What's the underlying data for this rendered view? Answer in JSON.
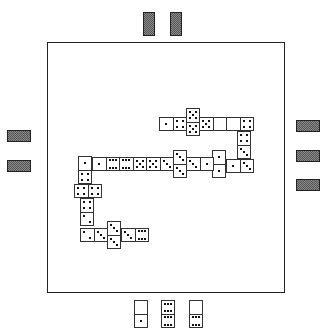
{
  "game": {
    "title": "Dominoes",
    "colors": {
      "background": "#ffffff",
      "frame": "#222222",
      "tile_face": "#ffffff",
      "tile_back": "#8a8a8a",
      "pip": "#111111"
    }
  },
  "opponents": {
    "top": {
      "hidden_tiles": 2,
      "backs": [
        {
          "x": 143,
          "y": 12,
          "w": 12,
          "h": 24
        },
        {
          "x": 170,
          "y": 12,
          "w": 12,
          "h": 24
        }
      ]
    },
    "left": {
      "hidden_tiles": 2,
      "backs": [
        {
          "x": 7,
          "y": 130,
          "w": 24,
          "h": 12
        },
        {
          "x": 7,
          "y": 160,
          "w": 24,
          "h": 12
        }
      ]
    },
    "right": {
      "hidden_tiles": 3,
      "backs": [
        {
          "x": 296,
          "y": 120,
          "w": 24,
          "h": 12
        },
        {
          "x": 296,
          "y": 150,
          "w": 24,
          "h": 12
        },
        {
          "x": 296,
          "y": 179,
          "w": 24,
          "h": 12
        }
      ]
    }
  },
  "player_hand": {
    "tiles": [
      {
        "a": 0,
        "b": 1,
        "x": 134,
        "y": 300,
        "w": 14,
        "h": 28,
        "orient": "v"
      },
      {
        "a": 6,
        "b": 6,
        "x": 161,
        "y": 300,
        "w": 14,
        "h": 28,
        "orient": "v"
      },
      {
        "a": 0,
        "b": 6,
        "x": 189,
        "y": 300,
        "w": 14,
        "h": 28,
        "orient": "v"
      }
    ]
  },
  "chain": {
    "tiles": [
      {
        "a": 1,
        "b": 4,
        "x": 159,
        "y": 117,
        "w": 28,
        "h": 14,
        "orient": "h"
      },
      {
        "a": 5,
        "b": 5,
        "x": 186,
        "y": 108,
        "w": 14,
        "h": 28,
        "orient": "v"
      },
      {
        "a": 5,
        "b": 0,
        "x": 199,
        "y": 117,
        "w": 28,
        "h": 14,
        "orient": "h"
      },
      {
        "a": 0,
        "b": 4,
        "x": 226,
        "y": 117,
        "w": 28,
        "h": 14,
        "orient": "h"
      },
      {
        "a": 4,
        "b": 3,
        "x": 237,
        "y": 131,
        "w": 14,
        "h": 28,
        "orient": "v"
      },
      {
        "a": 1,
        "b": 3,
        "x": 226,
        "y": 159,
        "w": 28,
        "h": 14,
        "orient": "h"
      },
      {
        "a": 1,
        "b": 1,
        "x": 212,
        "y": 150,
        "w": 14,
        "h": 28,
        "orient": "v"
      },
      {
        "a": 3,
        "b": 1,
        "x": 186,
        "y": 157,
        "w": 28,
        "h": 14,
        "orient": "h"
      },
      {
        "a": 3,
        "b": 3,
        "x": 173,
        "y": 150,
        "w": 14,
        "h": 28,
        "orient": "v"
      },
      {
        "a": 5,
        "b": 3,
        "x": 146,
        "y": 157,
        "w": 28,
        "h": 14,
        "orient": "h"
      },
      {
        "a": 6,
        "b": 5,
        "x": 119,
        "y": 157,
        "w": 28,
        "h": 14,
        "orient": "h"
      },
      {
        "a": 1,
        "b": 6,
        "x": 92,
        "y": 157,
        "w": 28,
        "h": 14,
        "orient": "h"
      },
      {
        "a": 1,
        "b": 4,
        "x": 78,
        "y": 156,
        "w": 14,
        "h": 28,
        "orient": "v"
      },
      {
        "a": 4,
        "b": 4,
        "x": 74,
        "y": 184,
        "w": 28,
        "h": 14,
        "orient": "h"
      },
      {
        "a": 4,
        "b": 2,
        "x": 80,
        "y": 198,
        "w": 14,
        "h": 28,
        "orient": "v"
      },
      {
        "a": 2,
        "b": 3,
        "x": 80,
        "y": 228,
        "w": 28,
        "h": 14,
        "orient": "h"
      },
      {
        "a": 3,
        "b": 3,
        "x": 107,
        "y": 221,
        "w": 14,
        "h": 28,
        "orient": "v"
      },
      {
        "a": 3,
        "b": 6,
        "x": 121,
        "y": 228,
        "w": 28,
        "h": 14,
        "orient": "h"
      }
    ]
  }
}
